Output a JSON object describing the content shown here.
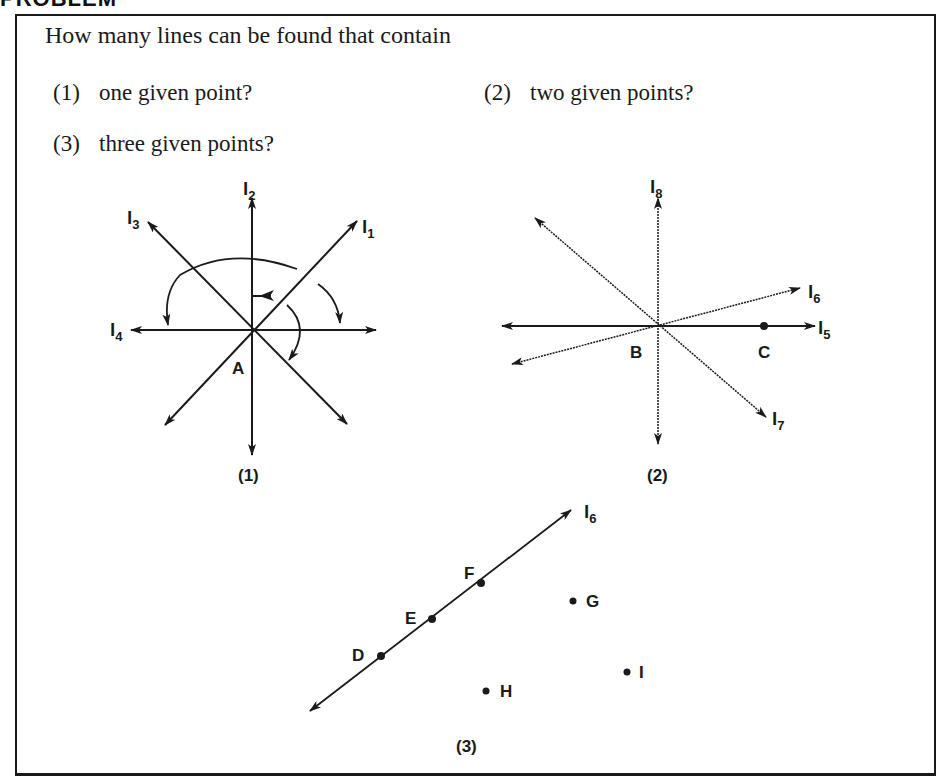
{
  "header": {
    "text": "PROBLEM"
  },
  "question": {
    "prompt": "How many lines can be found that contain",
    "items": [
      {
        "num": "(1)",
        "text": "one given point?"
      },
      {
        "num": "(2)",
        "text": "two given points?"
      },
      {
        "num": "(3)",
        "text": "three given points?"
      }
    ]
  },
  "figures": {
    "fig1": {
      "caption": "(1)",
      "point": "A",
      "lines": [
        "l1",
        "l2",
        "l3",
        "l4"
      ],
      "labels": {
        "l1": "l",
        "l1_sub": "1",
        "l2": "l",
        "l2_sub": "2",
        "l3": "l",
        "l3_sub": "3",
        "l4": "l",
        "l4_sub": "4"
      }
    },
    "fig2": {
      "caption": "(2)",
      "points": [
        "B",
        "C"
      ],
      "labels": {
        "l5": "l",
        "l5_sub": "5",
        "l6": "l",
        "l6_sub": "6",
        "l7": "l",
        "l7_sub": "7",
        "l8": "l",
        "l8_sub": "8",
        "B": "B",
        "C": "C"
      }
    },
    "fig3": {
      "caption": "(3)",
      "collinear_points": [
        "D",
        "E",
        "F"
      ],
      "other_points": [
        "G",
        "H",
        "I"
      ],
      "labels": {
        "line": "l",
        "line_sub": "6",
        "D": "D",
        "E": "E",
        "F": "F",
        "G": "G",
        "H": "H",
        "I": "I"
      }
    }
  }
}
